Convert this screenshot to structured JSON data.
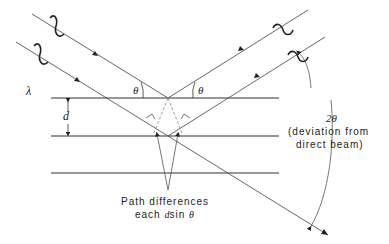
{
  "diagram": {
    "labels": {
      "wavelength": "λ",
      "spacing": "d",
      "theta_incident": "θ",
      "theta_reflected": "θ",
      "deviation_angle": "2θ",
      "deviation_line1": "(deviation from",
      "deviation_line2": "direct beam)",
      "path_line1": "Path differences",
      "path_line2_prefix": "each ",
      "path_line2_d": "d",
      "path_line2_sin": "sin ",
      "path_line2_theta": "θ"
    },
    "planes": [
      {
        "y": 98,
        "x1": 51,
        "x2": 279
      },
      {
        "y": 136,
        "x1": 51,
        "x2": 279
      },
      {
        "y": 173,
        "x1": 51,
        "x2": 279
      }
    ],
    "colors": {
      "line": "#333333",
      "dashed": "#888888",
      "text": "#222222"
    }
  }
}
